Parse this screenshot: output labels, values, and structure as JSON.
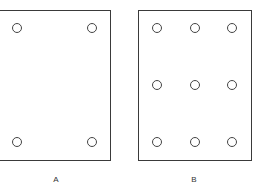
{
  "panels": [
    {
      "label": "A",
      "holes": [
        [
          17,
          28
        ],
        [
          92,
          28
        ],
        [
          17,
          142
        ],
        [
          92,
          142
        ]
      ]
    },
    {
      "label": "B",
      "holes": [
        [
          157,
          28
        ],
        [
          195,
          28
        ],
        [
          232,
          28
        ],
        [
          157,
          85
        ],
        [
          195,
          85
        ],
        [
          232,
          85
        ],
        [
          157,
          142
        ],
        [
          195,
          142
        ],
        [
          232,
          142
        ]
      ]
    }
  ]
}
